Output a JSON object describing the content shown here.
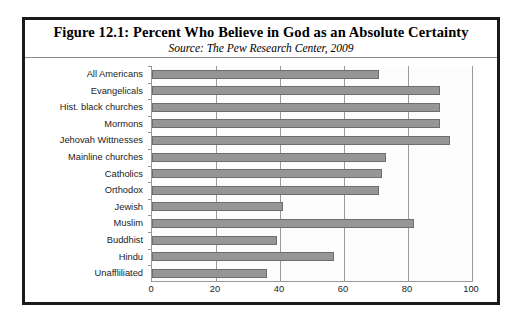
{
  "figure": {
    "title": "Figure 12.1:  Percent Who Believe in God as an Absolute Certainty",
    "subtitle": "Source: The Pew Research Center, 2009"
  },
  "chart_data": {
    "type": "bar",
    "orientation": "horizontal",
    "title": "Figure 12.1:  Percent Who Believe in God as an Absolute Certainty",
    "subtitle": "Source: The Pew Research Center, 2009",
    "xlabel": "",
    "ylabel": "",
    "xlim": [
      0,
      100
    ],
    "xticks": [
      0,
      20,
      40,
      60,
      80,
      100
    ],
    "grid": true,
    "legend": "none",
    "bar_color": "#969696",
    "bar_border_color": "#6e6e6e",
    "categories": [
      "All Americans",
      "Evangelicals",
      "Hist. black churches",
      "Mormons",
      "Jehovah Wittnesses",
      "Mainline churches",
      "Catholics",
      "Orthodox",
      "Jewish",
      "Muslim",
      "Buddhist",
      "Hindu",
      "Unaffliliated"
    ],
    "values": [
      71,
      90,
      90,
      90,
      93,
      73,
      72,
      71,
      41,
      82,
      39,
      57,
      36
    ]
  }
}
